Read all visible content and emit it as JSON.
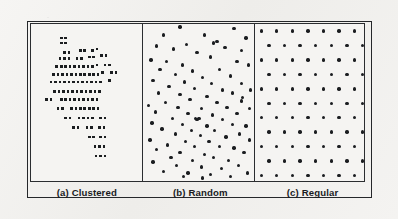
{
  "figure": {
    "kind": "point-pattern-illustration",
    "background_color": "#f2f1ef",
    "ink_color": "#1b1d20",
    "frame_color": "#25272a"
  },
  "panels": [
    {
      "id": "clustered",
      "tag": "(a)",
      "label": "Clustered"
    },
    {
      "id": "random",
      "tag": "(b)",
      "label": "Random"
    },
    {
      "id": "regular",
      "tag": "(c)",
      "label": "Regular"
    }
  ],
  "chart_data": {
    "type": "scatter",
    "title": "",
    "xlabel": "",
    "ylabel": "",
    "grid": false,
    "legend_position": "none",
    "axis_ticks": false,
    "xlim": [
      0,
      100
    ],
    "ylim": [
      0,
      100
    ],
    "panel_count": 3,
    "series": [
      {
        "name": "Clustered",
        "panel": "a",
        "marker": "square",
        "marker_size_px": 2.6,
        "count": 112,
        "points": [
          [
            27,
            9
          ],
          [
            31,
            9
          ],
          [
            27,
            12
          ],
          [
            31,
            12
          ],
          [
            30,
            18
          ],
          [
            34,
            18
          ],
          [
            44,
            17
          ],
          [
            48,
            17
          ],
          [
            55,
            17
          ],
          [
            59,
            16
          ],
          [
            26,
            22
          ],
          [
            30,
            22
          ],
          [
            34,
            22
          ],
          [
            41,
            22
          ],
          [
            45,
            22
          ],
          [
            52,
            21
          ],
          [
            56,
            21
          ],
          [
            63,
            20
          ],
          [
            67,
            20
          ],
          [
            23,
            27
          ],
          [
            27,
            27
          ],
          [
            31,
            27
          ],
          [
            35,
            27
          ],
          [
            39,
            27
          ],
          [
            43,
            27
          ],
          [
            47,
            27
          ],
          [
            51,
            27
          ],
          [
            55,
            27
          ],
          [
            59,
            26
          ],
          [
            66,
            26
          ],
          [
            70,
            26
          ],
          [
            20,
            32
          ],
          [
            24,
            32
          ],
          [
            28,
            32
          ],
          [
            32,
            32
          ],
          [
            36,
            32
          ],
          [
            40,
            32
          ],
          [
            44,
            32
          ],
          [
            48,
            32
          ],
          [
            52,
            32
          ],
          [
            56,
            32
          ],
          [
            60,
            32
          ],
          [
            64,
            31
          ],
          [
            72,
            31
          ],
          [
            76,
            31
          ],
          [
            18,
            37
          ],
          [
            22,
            37
          ],
          [
            26,
            37
          ],
          [
            30,
            37
          ],
          [
            34,
            37
          ],
          [
            38,
            37
          ],
          [
            42,
            37
          ],
          [
            46,
            37
          ],
          [
            50,
            37
          ],
          [
            54,
            37
          ],
          [
            58,
            37
          ],
          [
            62,
            37
          ],
          [
            70,
            36
          ],
          [
            21,
            43
          ],
          [
            25,
            43
          ],
          [
            29,
            43
          ],
          [
            33,
            43
          ],
          [
            37,
            43
          ],
          [
            41,
            43
          ],
          [
            45,
            43
          ],
          [
            49,
            43
          ],
          [
            53,
            43
          ],
          [
            57,
            43
          ],
          [
            61,
            43
          ],
          [
            14,
            48
          ],
          [
            18,
            48
          ],
          [
            27,
            48
          ],
          [
            31,
            48
          ],
          [
            35,
            48
          ],
          [
            39,
            48
          ],
          [
            43,
            48
          ],
          [
            47,
            48
          ],
          [
            51,
            48
          ],
          [
            55,
            48
          ],
          [
            59,
            48
          ],
          [
            24,
            54
          ],
          [
            28,
            54
          ],
          [
            36,
            54
          ],
          [
            40,
            54
          ],
          [
            44,
            54
          ],
          [
            48,
            54
          ],
          [
            52,
            54
          ],
          [
            56,
            54
          ],
          [
            60,
            54
          ],
          [
            31,
            60
          ],
          [
            35,
            60
          ],
          [
            43,
            60
          ],
          [
            47,
            60
          ],
          [
            51,
            60
          ],
          [
            55,
            60
          ],
          [
            62,
            60
          ],
          [
            66,
            60
          ],
          [
            38,
            66
          ],
          [
            42,
            66
          ],
          [
            50,
            66
          ],
          [
            54,
            66
          ],
          [
            61,
            66
          ],
          [
            65,
            66
          ],
          [
            52,
            72
          ],
          [
            56,
            72
          ],
          [
            62,
            72
          ],
          [
            66,
            72
          ],
          [
            57,
            78
          ],
          [
            61,
            78
          ],
          [
            65,
            78
          ],
          [
            58,
            84
          ],
          [
            62,
            84
          ],
          [
            66,
            84
          ]
        ]
      },
      {
        "name": "Random",
        "panel": "b",
        "marker": "circle",
        "marker_size_px": 3.4,
        "count": 96,
        "points": [
          [
            33,
            2
          ],
          [
            81,
            3
          ],
          [
            18,
            7
          ],
          [
            55,
            7
          ],
          [
            92,
            9
          ],
          [
            66,
            11
          ],
          [
            12,
            14
          ],
          [
            39,
            13
          ],
          [
            27,
            16
          ],
          [
            73,
            15
          ],
          [
            88,
            17
          ],
          [
            48,
            18
          ],
          [
            60,
            21
          ],
          [
            7,
            23
          ],
          [
            21,
            24
          ],
          [
            84,
            24
          ],
          [
            35,
            26
          ],
          [
            94,
            26
          ],
          [
            15,
            29
          ],
          [
            44,
            30
          ],
          [
            68,
            29
          ],
          [
            29,
            32
          ],
          [
            78,
            33
          ],
          [
            53,
            34
          ],
          [
            9,
            36
          ],
          [
            37,
            37
          ],
          [
            61,
            38
          ],
          [
            88,
            38
          ],
          [
            23,
            40
          ],
          [
            46,
            41
          ],
          [
            71,
            42
          ],
          [
            96,
            42
          ],
          [
            14,
            44
          ],
          [
            33,
            45
          ],
          [
            80,
            44
          ],
          [
            57,
            46
          ],
          [
            42,
            48
          ],
          [
            89,
            47
          ],
          [
            20,
            50
          ],
          [
            66,
            50
          ],
          [
            5,
            52
          ],
          [
            31,
            53
          ],
          [
            52,
            54
          ],
          [
            75,
            53
          ],
          [
            95,
            54
          ],
          [
            11,
            56
          ],
          [
            40,
            57
          ],
          [
            62,
            58
          ],
          [
            84,
            57
          ],
          [
            26,
            60
          ],
          [
            48,
            61
          ],
          [
            71,
            61
          ],
          [
            8,
            63
          ],
          [
            35,
            64
          ],
          [
            57,
            65
          ],
          [
            80,
            64
          ],
          [
            92,
            65
          ],
          [
            17,
            67
          ],
          [
            43,
            68
          ],
          [
            64,
            68
          ],
          [
            29,
            70
          ],
          [
            51,
            71
          ],
          [
            86,
            70
          ],
          [
            74,
            72
          ],
          [
            6,
            74
          ],
          [
            38,
            75
          ],
          [
            59,
            75
          ],
          [
            95,
            74
          ],
          [
            22,
            77
          ],
          [
            46,
            78
          ],
          [
            68,
            78
          ],
          [
            81,
            79
          ],
          [
            12,
            80
          ],
          [
            33,
            82
          ],
          [
            55,
            83
          ],
          [
            90,
            82
          ],
          [
            25,
            85
          ],
          [
            63,
            85
          ],
          [
            44,
            87
          ],
          [
            76,
            87
          ],
          [
            9,
            88
          ],
          [
            30,
            90
          ],
          [
            52,
            91
          ],
          [
            85,
            90
          ],
          [
            70,
            92
          ],
          [
            18,
            94
          ],
          [
            40,
            95
          ],
          [
            60,
            96
          ],
          [
            93,
            95
          ],
          [
            36,
            97
          ],
          [
            78,
            97
          ],
          [
            53,
            98
          ],
          [
            88,
            49
          ],
          [
            63,
            12
          ],
          [
            47,
            60
          ],
          [
            50,
            60
          ]
        ]
      },
      {
        "name": "Regular",
        "panel": "c",
        "marker": "circle",
        "marker_size_px": 3.4,
        "count": 78,
        "lattice": "staggered",
        "columns": 7,
        "rows": 11,
        "row_spacing": 9.2,
        "col_spacing": 14.3,
        "row_offset": 7.1
      }
    ]
  }
}
